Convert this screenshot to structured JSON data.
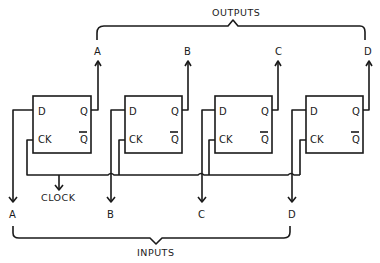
{
  "diagram": {
    "title_outputs": "OUTPUTS",
    "title_inputs": "INPUTS",
    "clock_label": "CLOCK",
    "flipflops": [
      {
        "d": "D",
        "ck": "CK",
        "q": "Q",
        "qbar": "Q",
        "output": "A",
        "input": "A"
      },
      {
        "d": "D",
        "ck": "CK",
        "q": "Q",
        "qbar": "Q",
        "output": "B",
        "input": "B"
      },
      {
        "d": "D",
        "ck": "CK",
        "q": "Q",
        "qbar": "Q",
        "output": "C",
        "input": "C"
      },
      {
        "d": "D",
        "ck": "CK",
        "q": "Q",
        "qbar": "Q",
        "output": "D",
        "input": "D"
      }
    ],
    "colors": {
      "line": "#1a1a1a",
      "background": "#ffffff"
    }
  }
}
